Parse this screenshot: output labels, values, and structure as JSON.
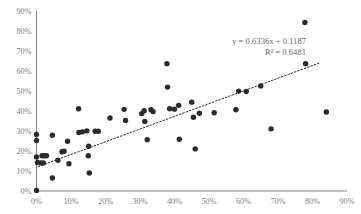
{
  "chart_data": {
    "type": "scatter",
    "title": "",
    "subtitle": "",
    "xlabel": "",
    "ylabel": "",
    "xlim": [
      0,
      90
    ],
    "ylim": [
      0,
      90
    ],
    "grid": false,
    "legend": null,
    "x_tick_labels": [
      "0%",
      "10%",
      "20%",
      "30%",
      "40%",
      "50%",
      "60%",
      "70%",
      "80%",
      "90%"
    ],
    "y_tick_labels": [
      "0%",
      "10%",
      "20%",
      "30%",
      "40%",
      "50%",
      "60%",
      "70%",
      "80%",
      "90%"
    ],
    "x_ticks": [
      0,
      10,
      20,
      30,
      40,
      50,
      60,
      70,
      80,
      90
    ],
    "y_ticks": [
      0,
      10,
      20,
      30,
      40,
      50,
      60,
      70,
      80,
      90
    ],
    "marker_color": "#2b2b2b",
    "axis_color": "#808080",
    "annotation_color": "#6b6b6b",
    "annotations": {
      "equation": "y = 0.6336x + 0.1187",
      "r_squared": "R² = 0.6481"
    },
    "trendline": {
      "type": "linear",
      "slope": 0.6336,
      "intercept": 0.1187,
      "x_start": 0.5,
      "x_end": 82.0,
      "style": "dotted"
    },
    "series": [
      {
        "name": "observations",
        "points": [
          [
            0.0,
            28.2
          ],
          [
            0.0,
            25.2
          ],
          [
            0.0,
            17.0
          ],
          [
            0.3,
            14.2
          ],
          [
            0.0,
            0.3
          ],
          [
            1.6,
            17.6
          ],
          [
            2.3,
            17.6
          ],
          [
            2.9,
            17.6
          ],
          [
            1.3,
            14.0
          ],
          [
            2.0,
            14.0
          ],
          [
            4.6,
            27.8
          ],
          [
            4.6,
            6.5
          ],
          [
            6.2,
            15.3
          ],
          [
            7.4,
            19.6
          ],
          [
            8.0,
            19.8
          ],
          [
            9.0,
            24.8
          ],
          [
            9.4,
            13.6
          ],
          [
            12.2,
            41.0
          ],
          [
            12.3,
            29.2
          ],
          [
            13.3,
            29.5
          ],
          [
            14.6,
            30.0
          ],
          [
            15.0,
            17.6
          ],
          [
            15.1,
            22.3
          ],
          [
            15.3,
            9.0
          ],
          [
            17.0,
            29.8
          ],
          [
            17.9,
            29.8
          ],
          [
            21.3,
            36.4
          ],
          [
            25.4,
            40.7
          ],
          [
            25.8,
            35.2
          ],
          [
            30.5,
            38.6
          ],
          [
            31.2,
            40.0
          ],
          [
            31.4,
            34.7
          ],
          [
            32.1,
            25.6
          ],
          [
            33.2,
            40.5
          ],
          [
            33.8,
            39.6
          ],
          [
            37.8,
            63.5
          ],
          [
            38.0,
            51.8
          ],
          [
            38.6,
            41.0
          ],
          [
            40.0,
            40.8
          ],
          [
            41.2,
            42.7
          ],
          [
            41.4,
            25.8
          ],
          [
            45.0,
            44.3
          ],
          [
            45.5,
            36.8
          ],
          [
            46.0,
            21.0
          ],
          [
            47.2,
            38.8
          ],
          [
            51.5,
            39.0
          ],
          [
            57.8,
            40.5
          ],
          [
            58.6,
            49.8
          ],
          [
            60.8,
            49.6
          ],
          [
            65.0,
            52.4
          ],
          [
            68.0,
            31.0
          ],
          [
            77.8,
            84.0
          ],
          [
            78.0,
            63.5
          ],
          [
            84.0,
            39.4
          ]
        ]
      }
    ]
  }
}
